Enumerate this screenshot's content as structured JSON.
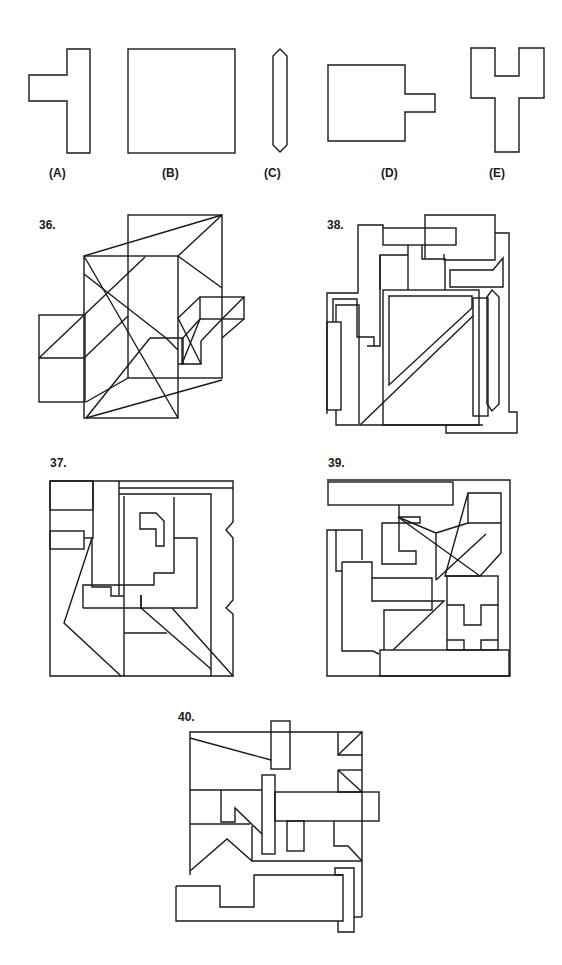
{
  "options": [
    {
      "key": "A",
      "label": "(A)",
      "shape": "t-shape"
    },
    {
      "key": "B",
      "label": "(B)",
      "shape": "square"
    },
    {
      "key": "C",
      "label": "(C)",
      "shape": "elongated-hexagon"
    },
    {
      "key": "D",
      "label": "(D)",
      "shape": "square-with-tab"
    },
    {
      "key": "E",
      "label": "(E)",
      "shape": "y-shape"
    }
  ],
  "questions": [
    {
      "number": "36.",
      "id": "q36"
    },
    {
      "number": "38.",
      "id": "q38"
    },
    {
      "number": "37.",
      "id": "q37"
    },
    {
      "number": "39.",
      "id": "q39"
    },
    {
      "number": "40.",
      "id": "q40"
    }
  ],
  "colors": {
    "stroke": "#1a1a1a",
    "background": "#ffffff"
  }
}
